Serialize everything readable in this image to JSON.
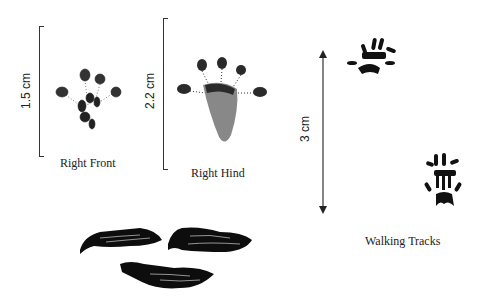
{
  "figure": {
    "panels": [
      {
        "id": "right-front",
        "caption": "Right Front",
        "scale_label": "1.5 cm"
      },
      {
        "id": "right-hind",
        "caption": "Right Hind",
        "scale_label": "2.2 cm"
      },
      {
        "id": "walking-tracks",
        "caption": "Walking Tracks",
        "scale_label": "3 cm"
      }
    ],
    "scat": {
      "count": 3
    }
  }
}
